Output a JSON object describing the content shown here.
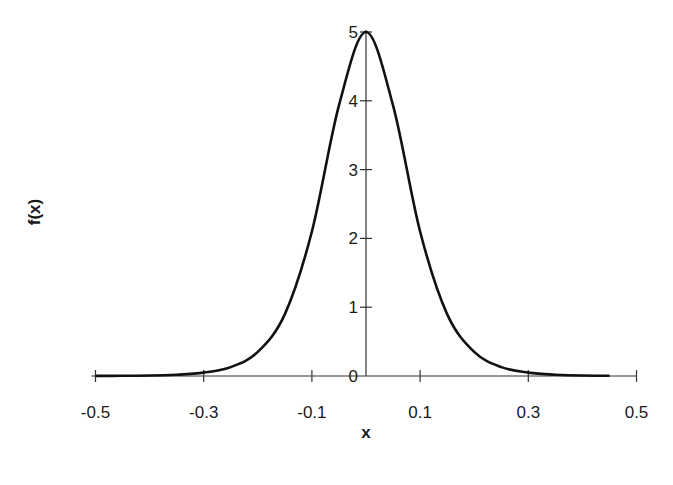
{
  "chart_data": {
    "type": "line",
    "title": "",
    "xlabel": "x",
    "ylabel": "f(x)",
    "xlim": [
      -0.5,
      0.5
    ],
    "ylim": [
      0,
      5
    ],
    "x_ticks": [
      -0.5,
      -0.3,
      -0.1,
      0.1,
      0.3,
      0.5
    ],
    "x_tick_labels": [
      "-0.5",
      "-0.3",
      "-0.1",
      "0.1",
      "0.3",
      "0.5"
    ],
    "y_ticks": [
      0,
      1,
      2,
      3,
      4,
      5
    ],
    "y_tick_labels": [
      "0",
      "1",
      "2",
      "3",
      "4",
      "5"
    ],
    "grid": false,
    "legend": null,
    "series": [
      {
        "name": "f(x)",
        "color": "#111111",
        "x": [
          -0.5,
          -0.45,
          -0.4,
          -0.35,
          -0.3,
          -0.25,
          -0.2,
          -0.15,
          -0.1,
          -0.05,
          0.0,
          0.05,
          0.1,
          0.15,
          0.2,
          0.25,
          0.3,
          0.35,
          0.4,
          0.45
        ],
        "values": [
          0.0009,
          0.0025,
          0.0067,
          0.018,
          0.049,
          0.13,
          0.35,
          0.9,
          2.1,
          3.93,
          5.0,
          3.93,
          2.1,
          0.9,
          0.35,
          0.13,
          0.049,
          0.018,
          0.0067,
          0.0025
        ]
      }
    ]
  }
}
